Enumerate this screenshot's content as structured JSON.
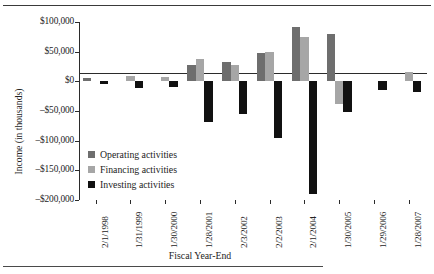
{
  "figure": {
    "rule_top": "horizontal-rule",
    "rule_bottom": "horizontal-rule"
  },
  "chart_data": {
    "type": "bar",
    "title": "",
    "xlabel": "Fiscal Year-End",
    "ylabel": "Income (in thousands)",
    "categories": [
      "2/1/1998",
      "1/31/1999",
      "1/30/2000",
      "1/28/2001",
      "2/3/2002",
      "2/2/2003",
      "2/1/2004",
      "1/30/2005",
      "1/29/2006",
      "1/28/2007"
    ],
    "series": [
      {
        "name": "Operating activities",
        "color": "#6e6e6e",
        "values": [
          5000,
          0,
          0,
          27000,
          32000,
          47000,
          91000,
          80000,
          0,
          0
        ]
      },
      {
        "name": "Financing activities",
        "color": "#a6a6a6",
        "values": [
          0,
          9000,
          7000,
          37000,
          28000,
          50000,
          75000,
          -38000,
          0,
          15000
        ]
      },
      {
        "name": "Investing activities",
        "color": "#111111",
        "values": [
          -4000,
          -11000,
          -9000,
          -68000,
          -55000,
          -96000,
          -190000,
          -51000,
          -14000,
          -18000
        ]
      }
    ],
    "ytick_labels": [
      "$100,000",
      "$50,000",
      "$0",
      "–$50,000",
      "–$100,000",
      "–$150,000",
      "–$200,000"
    ],
    "ytick_values": [
      100000,
      50000,
      0,
      -50000,
      -100000,
      -150000,
      -200000
    ],
    "ylim": [
      -200000,
      100000
    ],
    "grid": false,
    "legend_position": "inside-left",
    "legend": [
      {
        "label": "Operating activities",
        "color": "#6e6e6e"
      },
      {
        "label": "Financing activities",
        "color": "#a6a6a6"
      },
      {
        "label": "Investing activities",
        "color": "#111111"
      }
    ]
  }
}
